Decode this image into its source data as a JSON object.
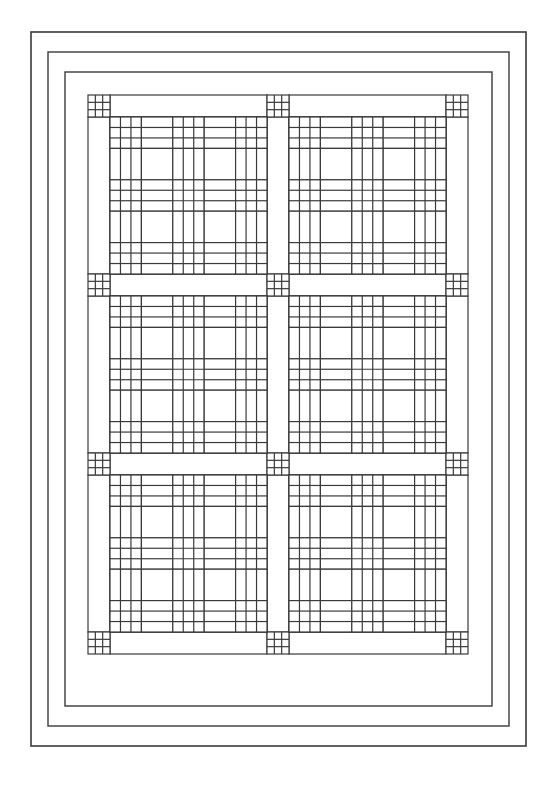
{
  "page": {
    "background_color": "#ffffff",
    "width": 557,
    "height": 787
  },
  "header": {
    "left_text": "",
    "middle_text": "",
    "right_text": "",
    "visible": true
  },
  "caption": {
    "bottom_text": ""
  },
  "diagram": {
    "name": "quilt-pattern-line-drawing",
    "line_color": "#3a3a3a",
    "fill_color": "#ffffff",
    "borders": [
      {
        "name": "outer-border",
        "x": 31,
        "y": 32,
        "width": 495,
        "height": 714,
        "stroke_width": 1.6
      },
      {
        "name": "middle-border",
        "x": 48,
        "y": 52,
        "width": 461,
        "height": 674,
        "stroke_width": 1.4
      },
      {
        "name": "inner-border",
        "x": 65,
        "y": 72,
        "width": 427,
        "height": 634,
        "stroke_width": 1.4
      }
    ],
    "quilt_field": {
      "name": "quilt-field",
      "x": 88,
      "y": 95,
      "width": 381,
      "height": 576
    },
    "grid": {
      "block_columns": 2,
      "block_rows": 3,
      "sashing_width": 22,
      "block_size": 157,
      "cornerstone_type": "nine-patch",
      "cornerstone_divisions": 3
    },
    "block": {
      "name": "pieced-block",
      "units_across": 5,
      "units_down": 5,
      "unit_types": {
        "corner": "nine-patch",
        "edge": "rail-fence",
        "center": "plain-square"
      },
      "layout_rows": [
        [
          "nine",
          "rail-h",
          "nine",
          "rail-h",
          "nine"
        ],
        [
          "rail-v",
          "plain",
          "rail-v",
          "plain",
          "rail-v"
        ],
        [
          "nine",
          "rail-h",
          "nine",
          "rail-h",
          "nine"
        ],
        [
          "rail-v",
          "plain",
          "rail-v",
          "plain",
          "rail-v"
        ],
        [
          "nine",
          "rail-h",
          "nine",
          "rail-h",
          "nine"
        ]
      ]
    }
  }
}
